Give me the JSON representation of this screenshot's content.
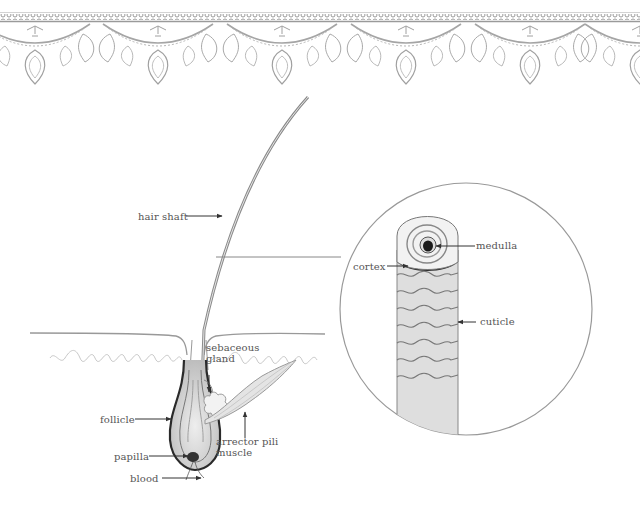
{
  "diagram": {
    "labels": {
      "hair_shaft": "hair shaft",
      "medulla": "medulla",
      "cortex": "cortex",
      "cuticle": "cuticle",
      "sebaceous_line1": "sebaceous",
      "sebaceous_line2": "gland",
      "follicle": "follicle",
      "papilla": "papilla",
      "blood": "blood",
      "arrector_line1": "arrector pili",
      "arrector_line2": "muscle"
    },
    "colors": {
      "line": "#444444",
      "label_text": "#555555",
      "lace": "#9a9a9a",
      "skin": "#bbbbbb",
      "follicle_dark": "#2a2a2a",
      "background": "#ffffff"
    }
  }
}
